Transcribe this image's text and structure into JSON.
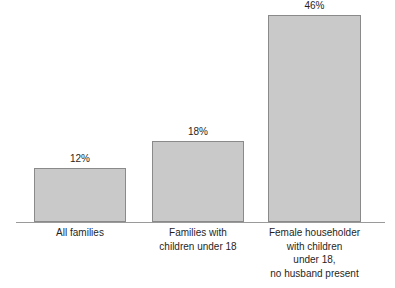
{
  "chart_data": {
    "type": "bar",
    "title": "",
    "subtitle": "",
    "xlabel": "",
    "ylabel": "",
    "ylim": [
      0,
      50
    ],
    "grid": false,
    "legend": false,
    "orientation": "vertical",
    "categories": [
      "All families",
      "Families with\nchildren under 18",
      "Female householder\nwith children\nunder 18,\nno husband present"
    ],
    "values": [
      12,
      18,
      46
    ],
    "value_labels": [
      "12%",
      "18%",
      "46%"
    ],
    "units": "percent",
    "bar_fill_color": "#c9c9c9",
    "bar_border_color": "#8a8a8a",
    "axis_color": "#9a9a9a",
    "text_color": "#1f1f1f",
    "background_color": "#ffffff"
  }
}
